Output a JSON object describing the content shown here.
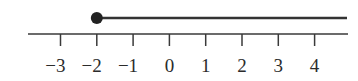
{
  "chart_data": {
    "type": "number_line",
    "title": "",
    "ticks": [
      -3,
      -2,
      -1,
      0,
      1,
      2,
      3,
      4
    ],
    "tick_labels": [
      "−3",
      "−2",
      "−1",
      "0",
      "1",
      "2",
      "3",
      "4"
    ],
    "xlim": [
      -3.9,
      4.9
    ],
    "ray": {
      "start": -2,
      "endpoint": "closed",
      "direction": "right"
    },
    "inequality": "x ≥ -2"
  },
  "colors": {
    "line": "#3a3a3a",
    "dot": "#222222",
    "text": "#2b2b2b"
  }
}
